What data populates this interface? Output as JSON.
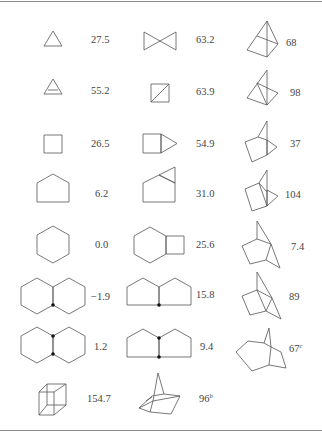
{
  "columns": [
    {
      "entries": [
        {
          "structure": "cyclopropane",
          "value": "27.5",
          "note": ""
        },
        {
          "structure": "cyclopropene",
          "value": "55.2",
          "note": ""
        },
        {
          "structure": "cyclobutane",
          "value": "26.5",
          "note": ""
        },
        {
          "structure": "cyclopentane",
          "value": "6.2",
          "note": ""
        },
        {
          "structure": "cyclohexane",
          "value": "0.0",
          "note": ""
        },
        {
          "structure": "trans-decalin",
          "value": "−1.9",
          "note": ""
        },
        {
          "structure": "cis-decalin",
          "value": "1.2",
          "note": ""
        },
        {
          "structure": "cubane",
          "value": "154.7",
          "note": ""
        }
      ]
    },
    {
      "entries": [
        {
          "structure": "spiropentane",
          "value": "63.2",
          "note": ""
        },
        {
          "structure": "bicyclobutane",
          "value": "63.9",
          "note": ""
        },
        {
          "structure": "bicyclopentane",
          "value": "54.9",
          "note": ""
        },
        {
          "structure": "bicyclohexane",
          "value": "31.0",
          "note": ""
        },
        {
          "structure": "bicyclooctane",
          "value": "25.6",
          "note": ""
        },
        {
          "structure": "trans-hydrindane",
          "value": "15.8",
          "note": ""
        },
        {
          "structure": "cis-hydrindane",
          "value": "9.4",
          "note": ""
        },
        {
          "structure": "tricyclic-cage",
          "value": "96",
          "note": "b"
        }
      ]
    },
    {
      "entries": [
        {
          "structure": "tetrahedrane-fused",
          "value": "68",
          "note": ""
        },
        {
          "structure": "tetrahedrane-bridged",
          "value": "98",
          "note": ""
        },
        {
          "structure": "bicyclo-propane-fused",
          "value": "37",
          "note": ""
        },
        {
          "structure": "tricyclo-fused",
          "value": "104",
          "note": ""
        },
        {
          "structure": "norbornane",
          "value": "7.4",
          "note": ""
        },
        {
          "structure": "tricyclo-norbornane",
          "value": "89",
          "note": ""
        },
        {
          "structure": "tricyclo-expanded",
          "value": "67",
          "note": "c"
        }
      ]
    }
  ]
}
